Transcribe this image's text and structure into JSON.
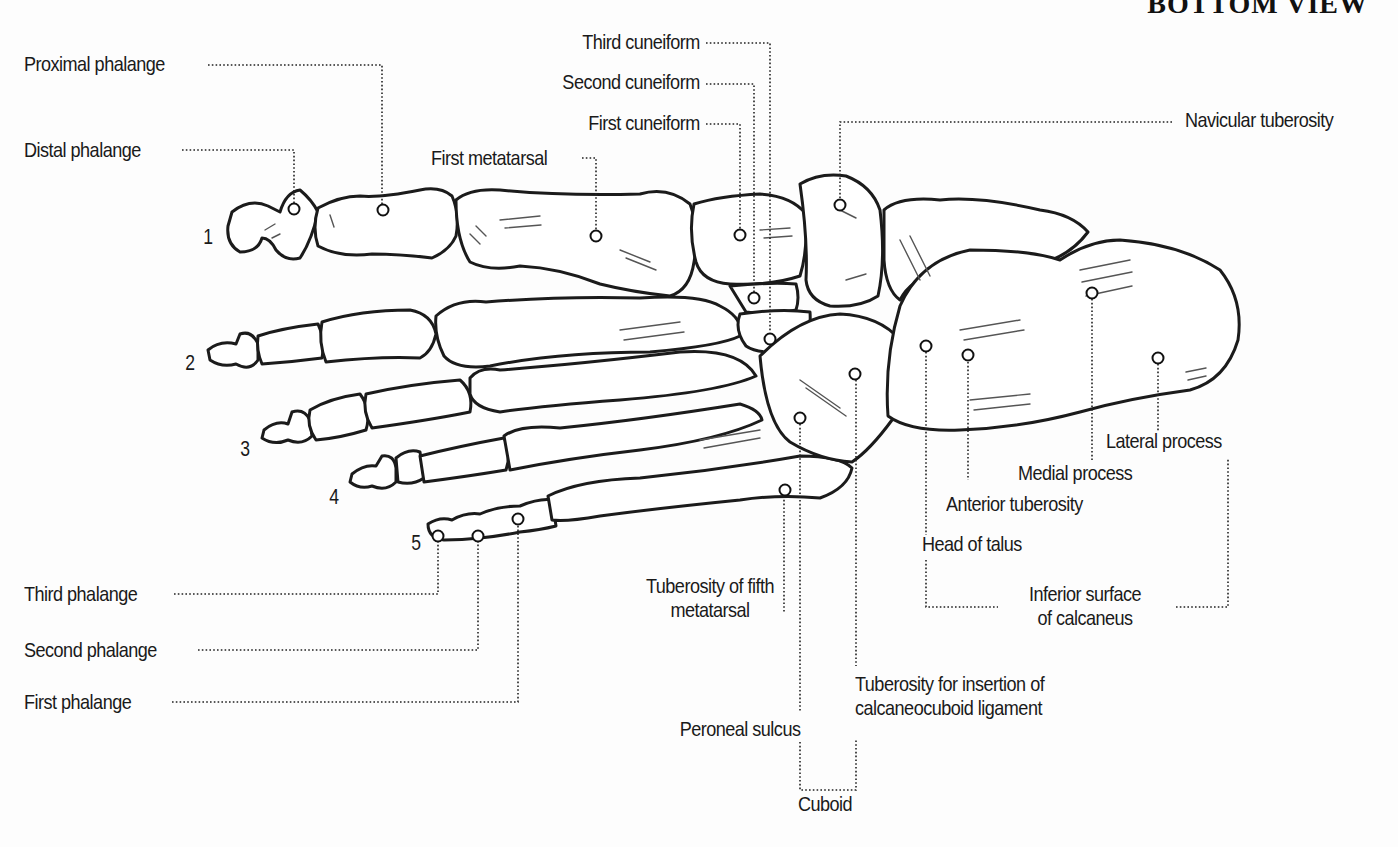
{
  "diagram": {
    "title": "BOTTOM VIEW",
    "toe_numbers": [
      "1",
      "2",
      "3",
      "4",
      "5"
    ],
    "labels": {
      "proximal_phalange": "Proximal phalange",
      "distal_phalange": "Distal phalange",
      "first_metatarsal": "First metatarsal",
      "third_cuneiform": "Third cuneiform",
      "second_cuneiform": "Second cuneiform",
      "first_cuneiform": "First cuneiform",
      "navicular_tuberosity": "Navicular tuberosity",
      "lateral_process": "Lateral process",
      "medial_process": "Medial process",
      "anterior_tuberosity": "Anterior tuberosity",
      "head_of_talus": "Head of talus",
      "inferior_surface_line1": "Inferior surface",
      "inferior_surface_line2": "of calcaneus",
      "tuberosity_fifth_line1": "Tuberosity of fifth",
      "tuberosity_fifth_line2": "metatarsal",
      "tuberosity_insertion_line1": "Tuberosity for insertion of",
      "tuberosity_insertion_line2": "calcaneocuboid ligament",
      "peroneal_sulcus": "Peroneal sulcus",
      "cuboid": "Cuboid",
      "third_phalange": "Third phalange",
      "second_phalange": "Second phalange",
      "first_phalange": "First phalange"
    },
    "colors": {
      "background": "#fdfdfd",
      "ink": "#1b1b1b",
      "hatch": "#555555"
    }
  }
}
